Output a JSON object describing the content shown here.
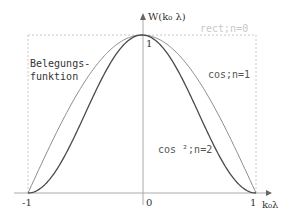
{
  "chart_data": {
    "type": "line",
    "title": "",
    "xlabel": "k₀λ",
    "ylabel": "W(k₀ λ)",
    "xlim": [
      -1,
      1
    ],
    "ylim": [
      0,
      1
    ],
    "xticks": [
      "-1",
      "0",
      "1"
    ],
    "yticks": [
      "1"
    ],
    "annotation": "Belegungs-\nfunktion",
    "annotation_lines": [
      "Belegungs-",
      "funktion"
    ],
    "series": [
      {
        "name": "rect;n=0",
        "label": "rect;n=0",
        "function": "1",
        "color": "#c8c8c8",
        "style": "dashed"
      },
      {
        "name": "cos;n=1",
        "label": "cos;n=1",
        "function": "cos(pi*x/2)",
        "color": "#888888"
      },
      {
        "name": "cos^2;n=2",
        "label": "cos ²;n=2",
        "function": "cos(pi*x/2)^2",
        "color": "#444444"
      }
    ]
  }
}
